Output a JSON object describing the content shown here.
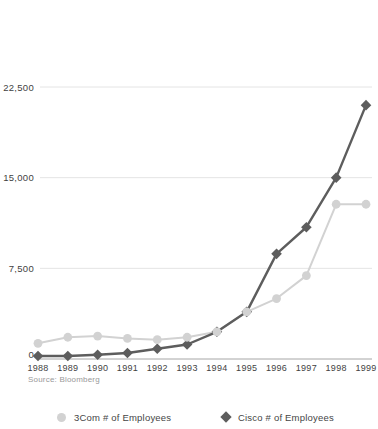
{
  "source_note": "Source: Bloomberg",
  "colors": {
    "com3": "#d2d2d2",
    "cisco": "#5d5d5d",
    "gridline": "#e4e4e4",
    "axis_line": "#a6a6a6",
    "tick_label": "#3f3f3f",
    "source_text": "#999999",
    "legend_text": "#454545",
    "background": "#ffffff"
  },
  "legend": [
    {
      "label": "3Com # of Employees",
      "marker": "circle"
    },
    {
      "label": "Cisco # of Employees",
      "marker": "diamond"
    }
  ],
  "chart_data": {
    "type": "line",
    "title": "",
    "xlabel": "",
    "ylabel": "",
    "x": [
      1988,
      1989,
      1990,
      1991,
      1992,
      1993,
      1994,
      1995,
      1996,
      1997,
      1998,
      1999
    ],
    "series": [
      {
        "name": "3Com # of Employees",
        "marker": "circle",
        "values": [
          1300,
          1800,
          1900,
          1700,
          1600,
          1800,
          2250,
          3900,
          5000,
          6900,
          12800,
          12800
        ]
      },
      {
        "name": "Cisco # of Employees",
        "marker": "diamond",
        "values": [
          250,
          250,
          350,
          500,
          850,
          1200,
          2250,
          3900,
          8700,
          10900,
          15000,
          21000
        ]
      }
    ],
    "yticks": [
      0,
      7500,
      15000,
      22500
    ],
    "ytick_labels": [
      "0",
      "7,500",
      "15,000",
      "22,500"
    ],
    "ylim": [
      0,
      22500
    ],
    "grid": "horizontal-only",
    "legend_position": "bottom",
    "source": "Source: Bloomberg"
  }
}
